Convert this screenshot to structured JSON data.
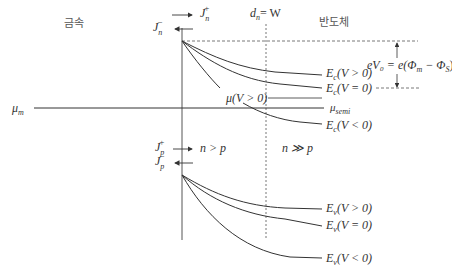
{
  "diagram": {
    "regions": {
      "metal_label": "금속",
      "semiconductor_label": "반도체"
    },
    "depletion_edge_label": "d",
    "depletion_edge_sub": "n",
    "depletion_edge_eq": "= W",
    "currents": {
      "Jn_plus": {
        "base": "J",
        "sub": "n",
        "sup": "+"
      },
      "Jn_minus": {
        "base": "J",
        "sub": "n",
        "sup": "−"
      },
      "Jp_plus": {
        "base": "J",
        "sub": "p",
        "sup": "+"
      },
      "Jp_minus": {
        "base": "J",
        "sub": "p",
        "sup": "−"
      }
    },
    "carrier_labels": {
      "near_interface": "n > p",
      "bulk": "n ≫ p"
    },
    "fermi_levels": {
      "metal": {
        "base": "μ",
        "sub": "m"
      },
      "semi": {
        "base": "μ",
        "sub": "semi"
      },
      "biased": "μ(V > 0)"
    },
    "barrier_label": "eV₀ = e(Φ",
    "barrier_label_m": "m",
    "barrier_label_mid": " − Φ",
    "barrier_label_s": "S",
    "barrier_label_end": ")",
    "conduction_band_curves": [
      {
        "base": "E",
        "sub": "c",
        "cond": "(V > 0)"
      },
      {
        "base": "E",
        "sub": "c",
        "cond": "(V = 0)"
      },
      {
        "base": "E",
        "sub": "c",
        "cond": "(V < 0)"
      }
    ],
    "valence_band_curves": [
      {
        "base": "E",
        "sub": "v",
        "cond": "(V > 0)"
      },
      {
        "base": "E",
        "sub": "v",
        "cond": "(V = 0)"
      },
      {
        "base": "E",
        "sub": "v",
        "cond": "(V < 0)"
      }
    ]
  }
}
